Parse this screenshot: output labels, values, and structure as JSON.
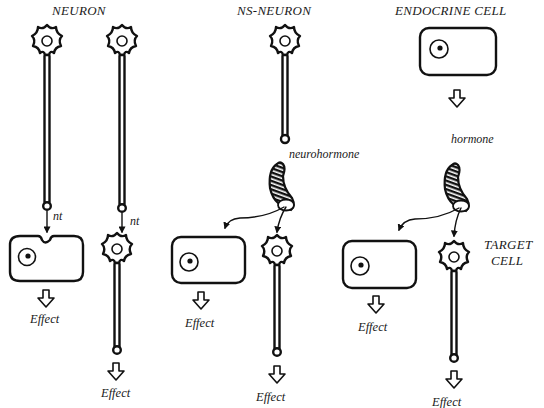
{
  "figure": {
    "type": "diagram",
    "columns": [
      {
        "heading": "NEURON",
        "pathways": [
          {
            "source": "neuron",
            "messenger": "nt",
            "target": "cell",
            "result": "Effect"
          },
          {
            "source": "neuron",
            "messenger": "nt",
            "target": "neuron",
            "result": "Effect"
          }
        ]
      },
      {
        "heading": "NS-NEURON",
        "messenger": "neurohormone",
        "pathways": [
          {
            "target": "cell",
            "result": "Effect"
          },
          {
            "target": "neuron",
            "result": "Effect"
          }
        ]
      },
      {
        "heading": "ENDOCRINE CELL",
        "messenger": "hormone",
        "pathways": [
          {
            "target": "cell",
            "result": "Effect"
          },
          {
            "target": "neuron",
            "result": "Effect"
          }
        ]
      }
    ],
    "side_label_line1": "TARGET",
    "side_label_line2": "CELL"
  },
  "labels": {
    "neuron_heading": "NEURON",
    "ns_neuron_heading": "NS-NEURON",
    "endocrine_heading": "ENDOCRINE CELL",
    "nt": "nt",
    "neurohormone": "neurohormone",
    "hormone": "hormone",
    "effect": "Effect",
    "target_line1": "TARGET",
    "target_line2": "CELL"
  }
}
